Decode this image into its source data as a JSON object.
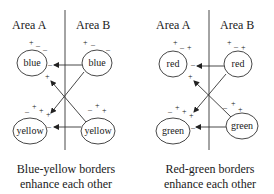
{
  "panels": [
    {
      "id": "blue-yellow",
      "area_a": "Area A",
      "area_b": "Area B",
      "top_left_label": "blue",
      "top_right_label": "blue",
      "bottom_left_label": "yellow",
      "bottom_right_label": "yellow",
      "caption_line1": "Blue-yellow borders",
      "caption_line2": "enhance each other",
      "signs": {
        "tl_plus": "+",
        "tl_minus1": "–",
        "tl_minus2": "–",
        "tl_side_minus": "–",
        "tl_below_plus": "+",
        "tr_plus": "+",
        "tr_minus1": "–",
        "tr_minus2": "–",
        "bl_minus": "–",
        "bl_plus1": "+",
        "bl_plus2": "+",
        "bl_plus3": "+",
        "bl_side_minus": "–",
        "br_minus": "–",
        "br_plus1": "+",
        "br_plus2": "+"
      }
    },
    {
      "id": "red-green",
      "area_a": "Area A",
      "area_b": "Area B",
      "top_left_label": "red",
      "top_right_label": "red",
      "bottom_left_label": "green",
      "bottom_right_label": "green",
      "caption_line1": "Red-green borders",
      "caption_line2": "enhance each other",
      "signs": {
        "tl_plus": "+",
        "tl_minus1": "–",
        "tl_minus2": "+",
        "tl_side_minus": "–",
        "tl_below_plus": "+",
        "tr_plus": "+",
        "tr_minus1": "–",
        "tr_minus2": "+",
        "bl_minus": "–",
        "bl_plus1": "+",
        "bl_plus2": "+",
        "bl_plus3": "+",
        "bl_side_minus": "–",
        "br_minus": "–",
        "br_plus1": "+",
        "br_plus2": "+"
      }
    }
  ]
}
